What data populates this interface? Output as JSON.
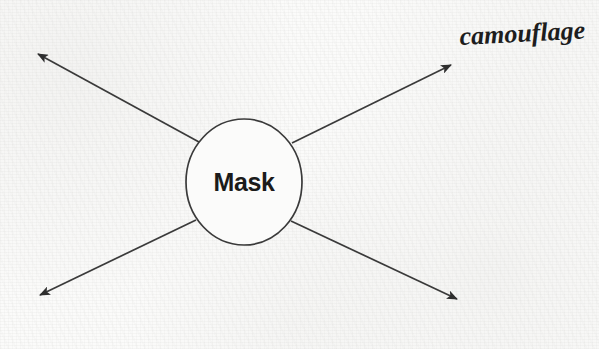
{
  "canvas": {
    "width": 599,
    "height": 349,
    "background_color": "#fbfbfa",
    "ink_color": "#333333",
    "text_color": "#1b1b1b"
  },
  "diagram": {
    "type": "radial-spoke-diagram",
    "center_node": {
      "label": "Mask",
      "shape": "ellipse",
      "cx": 244,
      "cy": 182,
      "rx": 58,
      "ry": 63,
      "stroke_color": "#3a3a3a",
      "fill": "none"
    },
    "arrows": [
      {
        "name": "arrow-top-left",
        "direction": "up-left",
        "from": {
          "x": 199,
          "y": 142
        },
        "to": {
          "x": 33,
          "y": 51
        }
      },
      {
        "name": "arrow-top-right",
        "direction": "up-right",
        "from": {
          "x": 292,
          "y": 143
        },
        "to": {
          "x": 456,
          "y": 62
        }
      },
      {
        "name": "arrow-bottom-left",
        "direction": "down-left",
        "from": {
          "x": 196,
          "y": 220
        },
        "to": {
          "x": 35,
          "y": 298
        }
      },
      {
        "name": "arrow-bottom-right",
        "direction": "down-right",
        "from": {
          "x": 291,
          "y": 221
        },
        "to": {
          "x": 462,
          "y": 302
        }
      }
    ],
    "annotations": [
      {
        "name": "annotation-camouflage",
        "text": "camouflage",
        "style": "handwritten-script",
        "x": 460,
        "y": 45,
        "attached_to": "arrow-top-right"
      }
    ]
  }
}
